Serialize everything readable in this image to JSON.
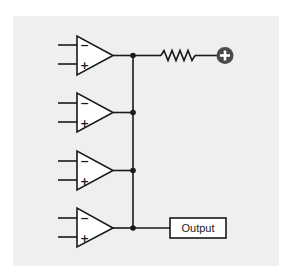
{
  "diagram": {
    "type": "circuit-schematic",
    "colors": {
      "background": "#ffffff",
      "panel": "#efefef",
      "stroke": "#1a1a1a",
      "supply_circle": "#4a4a4a"
    },
    "op_amps": [
      {
        "id": "opamp-1",
        "inverting_label": "−",
        "noninverting_label": "+"
      },
      {
        "id": "opamp-2",
        "inverting_label": "−",
        "noninverting_label": "+"
      },
      {
        "id": "opamp-3",
        "inverting_label": "−",
        "noninverting_label": "+"
      },
      {
        "id": "opamp-4",
        "inverting_label": "−",
        "noninverting_label": "+"
      }
    ],
    "pullup": {
      "component": "resistor",
      "supply_symbol": "plus-circle-icon",
      "supply_label": "+"
    },
    "output": {
      "label": "Output"
    }
  }
}
